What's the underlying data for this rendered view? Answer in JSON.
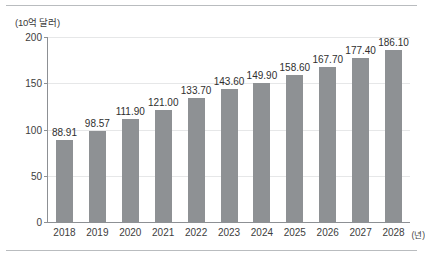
{
  "chart_data": {
    "type": "bar",
    "title": "",
    "subtitle": "",
    "ylabel": "(10억 달러)",
    "xlabel": "(년)",
    "categories": [
      "2018",
      "2019",
      "2020",
      "2021",
      "2022",
      "2023",
      "2024",
      "2025",
      "2026",
      "2027",
      "2028"
    ],
    "values": [
      88.91,
      98.57,
      111.9,
      121.0,
      133.7,
      143.6,
      149.9,
      158.6,
      167.7,
      177.4,
      186.1
    ],
    "value_labels": [
      "88.91",
      "98.57",
      "111.90",
      "121.00",
      "133.70",
      "143.60",
      "149.90",
      "158.60",
      "167.70",
      "177.40",
      "186.10"
    ],
    "ylim": [
      0,
      200
    ],
    "yticks": [
      0,
      50,
      100,
      150,
      200
    ],
    "ytick_labels": [
      "0",
      "50",
      "100",
      "150",
      "200"
    ],
    "grid": true,
    "grid_axis": "y",
    "legend": false,
    "legend_position": "none",
    "series": [
      {
        "name": "",
        "values": [
          88.91,
          98.57,
          111.9,
          121.0,
          133.7,
          143.6,
          149.9,
          158.6,
          167.7,
          177.4,
          186.1
        ]
      }
    ]
  },
  "colors": {
    "bar": "#8e9194",
    "grid": "#e6e7e8",
    "axis": "#8d9094",
    "rule": "#b9bcbf",
    "tick_text": "#3d3d3d",
    "label_text": "#2f2f2f",
    "background": "#ffffff"
  }
}
